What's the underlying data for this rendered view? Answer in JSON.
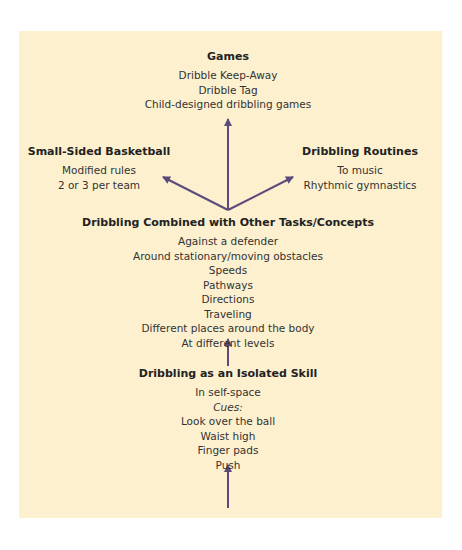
{
  "colors": {
    "panel": "#fdf0cf",
    "arrow": "#5b4a7a",
    "text": "#2b2b2b"
  },
  "nodes": {
    "games": {
      "title": "Games",
      "items": [
        "Dribble Keep-Away",
        "Dribble Tag",
        "Child-designed dribbling games"
      ]
    },
    "small_sided": {
      "title": "Small-Sided Basketball",
      "items": [
        "Modified rules",
        "2 or 3 per team"
      ]
    },
    "routines": {
      "title": "Dribbling Routines",
      "items": [
        "To music",
        "Rhythmic gymnastics"
      ]
    },
    "combined": {
      "title": "Dribbling Combined with Other Tasks/Concepts",
      "items": [
        "Against a defender",
        "Around stationary/moving obstacles",
        "Speeds",
        "Pathways",
        "Directions",
        "Traveling",
        "Different places around the body",
        "At different levels"
      ]
    },
    "isolated": {
      "title": "Dribbling as an Isolated Skill",
      "items": [
        "In self-space",
        "Cues:",
        "Look over the ball",
        "Waist high",
        "Finger pads",
        "Push"
      ]
    }
  }
}
